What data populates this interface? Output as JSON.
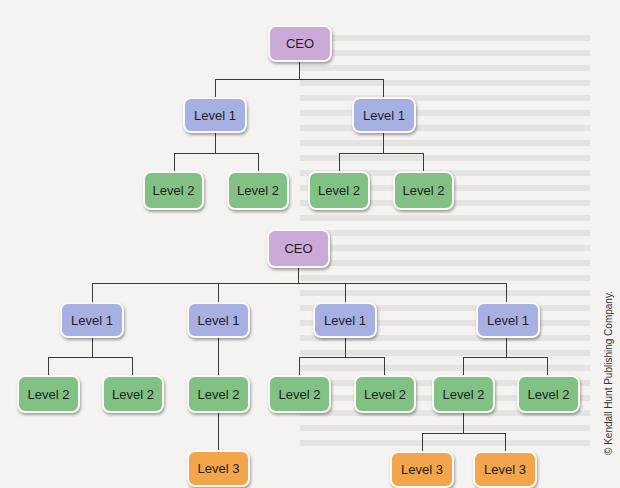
{
  "diagrams": [
    {
      "name": "org-chart-top",
      "root": {
        "label": "CEO"
      },
      "level1": [
        {
          "label": "Level 1",
          "children": [
            {
              "label": "Level 2"
            },
            {
              "label": "Level 2"
            }
          ]
        },
        {
          "label": "Level 1",
          "children": [
            {
              "label": "Level 2"
            },
            {
              "label": "Level 2"
            }
          ]
        }
      ]
    },
    {
      "name": "org-chart-bottom",
      "root": {
        "label": "CEO"
      },
      "level1": [
        {
          "label": "Level 1",
          "children": [
            {
              "label": "Level 2"
            },
            {
              "label": "Level 2"
            }
          ]
        },
        {
          "label": "Level 1",
          "children": [
            {
              "label": "Level 2",
              "children": [
                {
                  "label": "Level 3"
                }
              ]
            }
          ]
        },
        {
          "label": "Level 1",
          "children": [
            {
              "label": "Level 2"
            },
            {
              "label": "Level 2"
            }
          ]
        },
        {
          "label": "Level 1",
          "children": [
            {
              "label": "Level 2",
              "children": [
                {
                  "label": "Level 3"
                },
                {
                  "label": "Level 3"
                }
              ]
            },
            {
              "label": "Level 2"
            }
          ]
        }
      ]
    }
  ],
  "colors": {
    "ceo": "#cba9d8",
    "level1": "#a7b0e2",
    "level2": "#82c184",
    "level3": "#f3a54b",
    "connector": "#3a3a3a"
  },
  "copyright": "© Kendall Hunt Publishing Company."
}
